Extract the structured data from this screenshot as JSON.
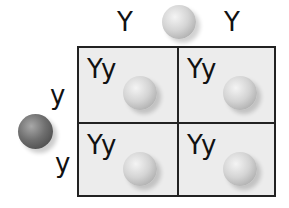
{
  "diagram": {
    "type": "punnett-square",
    "top_parent": {
      "alleles": [
        "Y",
        "Y"
      ],
      "pea_color": "light"
    },
    "left_parent": {
      "alleles": [
        "y",
        "y"
      ],
      "pea_color": "dark"
    },
    "cells": [
      {
        "genotype": "Yy",
        "pea_color": "light"
      },
      {
        "genotype": "Yy",
        "pea_color": "light"
      },
      {
        "genotype": "Yy",
        "pea_color": "light"
      },
      {
        "genotype": "Yy",
        "pea_color": "light"
      }
    ],
    "colors": {
      "grid_border": "#222222",
      "cell_background": "#ececec",
      "light_pea": "#d4d4d4",
      "dark_pea": "#6f6f6f"
    }
  }
}
